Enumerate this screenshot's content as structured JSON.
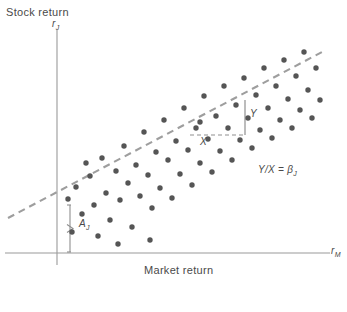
{
  "figure": {
    "axes": {
      "y_title": "Stock return",
      "y_symbol": "r",
      "y_symbol_sub": "J",
      "x_title": "Market return",
      "x_symbol": "r",
      "x_symbol_sub": "M"
    },
    "annotations": {
      "rise_label": "Y",
      "run_label": "X",
      "intercept_label": "A",
      "intercept_label_sub": "J",
      "slope_formula": "Y/X = β",
      "slope_formula_sub": "J"
    },
    "colors": {
      "axis": "#9a9a9a",
      "point": "#555555",
      "regression_line": "#9e9e9e",
      "annotation_line": "#8f8f8f",
      "text": "#4a4a4a",
      "background": "#ffffff"
    }
  },
  "chart_data": {
    "type": "scatter",
    "title": "",
    "xlabel": "Market return",
    "ylabel": "Stock return",
    "grid": false,
    "legend": false,
    "axis_pixels": {
      "y_axis_x": 57,
      "y_axis_top": 30,
      "y_axis_bottom": 265,
      "x_axis_y": 253,
      "x_axis_left": 5,
      "x_axis_right": 330
    },
    "regression_line": {
      "style": "dashed",
      "x1": 8,
      "y1": 218,
      "x2": 322,
      "y2": 52,
      "intercept_pixel_y": 205
    },
    "slope_triangle": {
      "corner_x": 245,
      "corner_y": 135,
      "run_start_x": 190,
      "rise_top_y": 100
    },
    "intercept_bracket": {
      "x": 70,
      "top_y": 205,
      "bottom_y": 252
    },
    "points": [
      [
        68,
        199
      ],
      [
        72,
        232
      ],
      [
        76,
        187
      ],
      [
        82,
        214
      ],
      [
        90,
        176
      ],
      [
        94,
        205
      ],
      [
        98,
        236
      ],
      [
        102,
        158
      ],
      [
        106,
        193
      ],
      [
        110,
        220
      ],
      [
        116,
        171
      ],
      [
        120,
        200
      ],
      [
        124,
        146
      ],
      [
        128,
        183
      ],
      [
        132,
        227
      ],
      [
        136,
        165
      ],
      [
        140,
        196
      ],
      [
        144,
        132
      ],
      [
        148,
        175
      ],
      [
        152,
        208
      ],
      [
        156,
        152
      ],
      [
        160,
        188
      ],
      [
        164,
        120
      ],
      [
        168,
        160
      ],
      [
        172,
        198
      ],
      [
        176,
        141
      ],
      [
        180,
        174
      ],
      [
        184,
        108
      ],
      [
        188,
        150
      ],
      [
        192,
        185
      ],
      [
        196,
        128
      ],
      [
        200,
        163
      ],
      [
        204,
        96
      ],
      [
        208,
        139
      ],
      [
        212,
        172
      ],
      [
        216,
        116
      ],
      [
        220,
        151
      ],
      [
        224,
        86
      ],
      [
        228,
        128
      ],
      [
        232,
        160
      ],
      [
        236,
        105
      ],
      [
        240,
        140
      ],
      [
        244,
        78
      ],
      [
        248,
        118
      ],
      [
        252,
        148
      ],
      [
        256,
        95
      ],
      [
        260,
        130
      ],
      [
        264,
        68
      ],
      [
        268,
        108
      ],
      [
        272,
        138
      ],
      [
        276,
        86
      ],
      [
        280,
        120
      ],
      [
        284,
        60
      ],
      [
        288,
        99
      ],
      [
        292,
        128
      ],
      [
        296,
        76
      ],
      [
        300,
        110
      ],
      [
        304,
        52
      ],
      [
        308,
        90
      ],
      [
        312,
        118
      ],
      [
        316,
        68
      ],
      [
        320,
        100
      ],
      [
        150,
        240
      ],
      [
        200,
        122
      ],
      [
        118,
        244
      ],
      [
        86,
        163
      ]
    ],
    "note": "Point coordinates are figure-pixel positions (x right, y down) of the ~66 plotted observations."
  }
}
